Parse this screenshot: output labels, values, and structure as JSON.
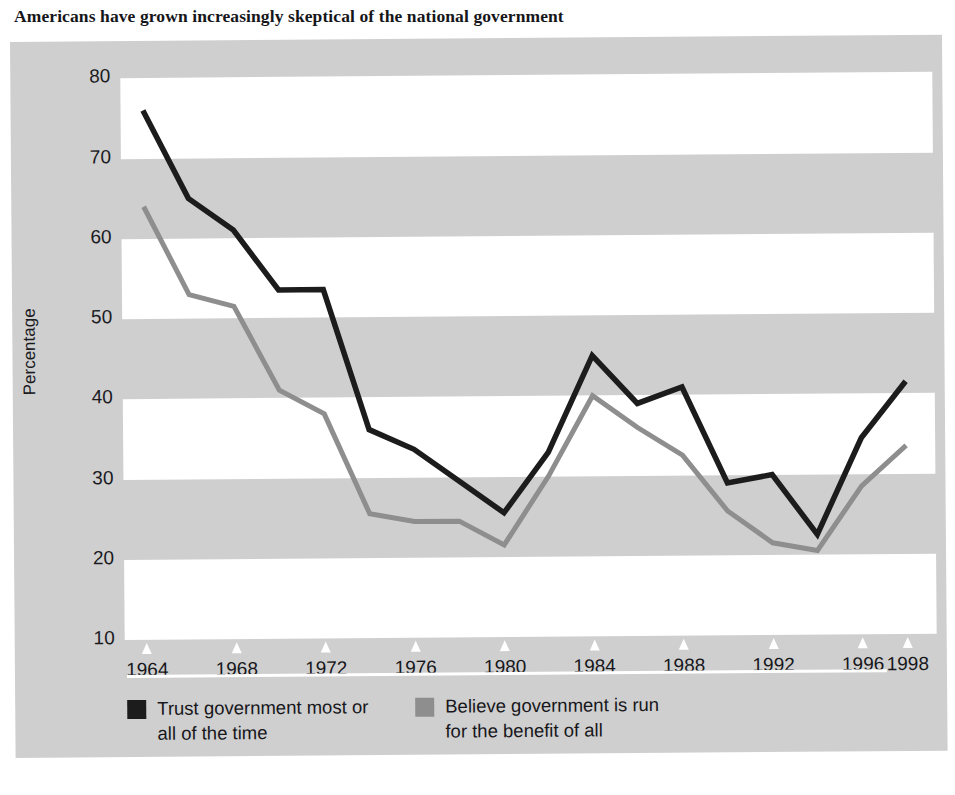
{
  "title": "Americans have grown increasingly skeptical of the national government",
  "axis": {
    "ylabel": "Percentage",
    "yticks": [
      "80",
      "70",
      "60",
      "50",
      "40",
      "30",
      "20",
      "10"
    ],
    "xticks": [
      "1964",
      "1968",
      "1972",
      "1976",
      "1980",
      "1984",
      "1988",
      "1992",
      "1996",
      "1998"
    ]
  },
  "legend": {
    "items": [
      {
        "label_line1": "Trust government most or",
        "label_line2": "all of the time",
        "color": "#1c1c1c"
      },
      {
        "label_line1": "Believe government is run",
        "label_line2": "for the benefit of all",
        "color": "#8e8e8e"
      }
    ]
  },
  "colors": {
    "panel": "#cfcfcf",
    "band_white": "#ffffff",
    "series_trust": "#1c1c1c",
    "series_benefit": "#8e8e8e",
    "text": "#17171b"
  },
  "chart_data": {
    "type": "line",
    "title": "Americans have grown increasingly skeptical of the national government",
    "xlabel": "",
    "ylabel": "Percentage",
    "xlim": [
      1963,
      1999
    ],
    "ylim": [
      10,
      80
    ],
    "yticks": [
      10,
      20,
      30,
      40,
      50,
      60,
      70,
      80
    ],
    "xticks": [
      1964,
      1968,
      1972,
      1976,
      1980,
      1984,
      1988,
      1992,
      1996,
      1998
    ],
    "grid": "alternating horizontal bands (white over gray), every 10 percentage points",
    "legend_position": "below plot, two columns",
    "series": [
      {
        "name": "Trust government most or all of the time",
        "color": "#1c1c1c",
        "x": [
          1964,
          1966,
          1968,
          1970,
          1972,
          1974,
          1976,
          1978,
          1980,
          1982,
          1984,
          1986,
          1988,
          1990,
          1992,
          1994,
          1996,
          1998
        ],
        "values": [
          76,
          65,
          61,
          53.5,
          53.5,
          36,
          33.5,
          29.5,
          25.5,
          33,
          45,
          39,
          41,
          29,
          30,
          22.5,
          34.5,
          41.5
        ]
      },
      {
        "name": "Believe government is run for the benefit of all",
        "color": "#8e8e8e",
        "x": [
          1964,
          1966,
          1968,
          1970,
          1972,
          1974,
          1976,
          1978,
          1980,
          1982,
          1984,
          1986,
          1988,
          1990,
          1992,
          1994,
          1996,
          1998
        ],
        "values": [
          64,
          53,
          51.5,
          41,
          38,
          25.5,
          24.5,
          24.5,
          21.5,
          30,
          40,
          36,
          32.5,
          25.5,
          21.5,
          20.5,
          28.5,
          33.5
        ]
      }
    ]
  }
}
